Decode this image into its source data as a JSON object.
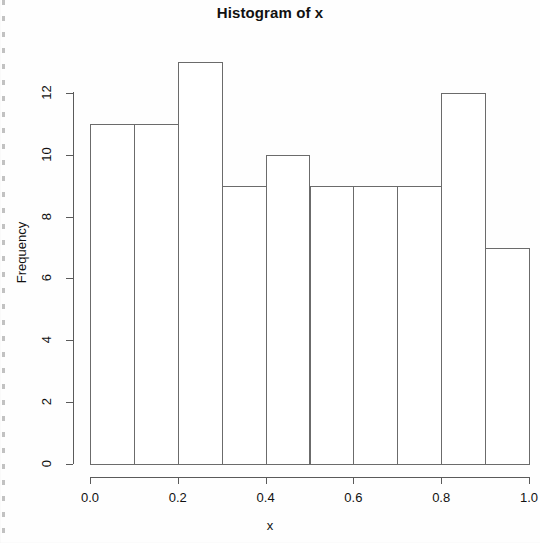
{
  "chart_data": {
    "type": "bar",
    "title": "Histogram of x",
    "xlabel": "x",
    "ylabel": "Frequency",
    "bin_edges": [
      0.0,
      0.1,
      0.2,
      0.3,
      0.4,
      0.5,
      0.6,
      0.7,
      0.8,
      0.9,
      1.0
    ],
    "categories": [
      "0.0-0.1",
      "0.1-0.2",
      "0.2-0.3",
      "0.3-0.4",
      "0.4-0.5",
      "0.5-0.6",
      "0.6-0.7",
      "0.7-0.8",
      "0.8-0.9",
      "0.9-1.0"
    ],
    "values": [
      11,
      11,
      13,
      9,
      10,
      9,
      9,
      9,
      12,
      7
    ],
    "xlim": [
      0.0,
      1.0
    ],
    "ylim": [
      0,
      13
    ],
    "x_ticks": [
      0.0,
      0.2,
      0.4,
      0.6,
      0.8,
      1.0
    ],
    "x_tick_labels": [
      "0.0",
      "0.2",
      "0.4",
      "0.6",
      "0.8",
      "1.0"
    ],
    "y_ticks": [
      0,
      2,
      4,
      6,
      8,
      10,
      12
    ],
    "y_tick_labels": [
      "0",
      "2",
      "4",
      "6",
      "8",
      "10",
      "12"
    ],
    "grid": false,
    "legend": null,
    "bar_fill": "#ffffff",
    "bar_stroke": "#6b6b6b",
    "background": "#fefefe",
    "text_color": "#111111",
    "total_count": 100
  },
  "geometry": {
    "plot_left": 90,
    "plot_right": 529,
    "plot_baseline": 464,
    "y_axis_x": 73,
    "y_axis_top": 92,
    "px_per_unit": 30.92
  }
}
